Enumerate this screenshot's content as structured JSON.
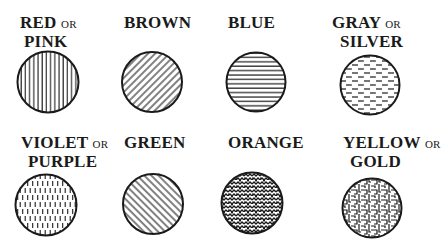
{
  "colors": {
    "ink": "#1a1a1a",
    "background": "#ffffff"
  },
  "items": [
    {
      "name": "RED",
      "or": "OR",
      "alt": "PINK",
      "pattern": "vertical-lines"
    },
    {
      "name": "BROWN",
      "or": "",
      "alt": "",
      "pattern": "diagonal-lines-rising"
    },
    {
      "name": "BLUE",
      "or": "",
      "alt": "",
      "pattern": "horizontal-lines"
    },
    {
      "name": "GRAY",
      "or": "OR",
      "alt": "SILVER",
      "pattern": "horizontal-dashes"
    },
    {
      "name": "VIOLET",
      "or": "OR",
      "alt": "PURPLE",
      "pattern": "vertical-dashes"
    },
    {
      "name": "GREEN",
      "or": "",
      "alt": "",
      "pattern": "diagonal-lines-falling"
    },
    {
      "name": "ORANGE",
      "or": "",
      "alt": "",
      "pattern": "zigzag-crosshatch"
    },
    {
      "name": "YELLOW",
      "or": "OR",
      "alt": "GOLD",
      "pattern": "fret-maze"
    }
  ]
}
